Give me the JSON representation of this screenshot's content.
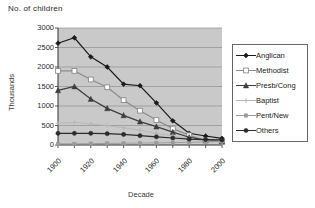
{
  "header": {
    "title": "No. of children"
  },
  "chart_data": {
    "type": "line",
    "title": "No. of children",
    "xlabel": "Decade",
    "ylabel": "Thousands",
    "grid": true,
    "legend_position": "right",
    "plot_background": "#c9c9c9",
    "xlim": [
      1900,
      2000
    ],
    "ylim": [
      0,
      3000
    ],
    "ytick_step": 500,
    "yticks": [
      0,
      500,
      1000,
      1500,
      2000,
      2500,
      3000
    ],
    "xticks": [
      1900,
      1920,
      1940,
      1960,
      1980,
      2000
    ],
    "x": [
      1900,
      1910,
      1920,
      1930,
      1940,
      1950,
      1960,
      1970,
      1980,
      1990,
      2000
    ],
    "series": [
      {
        "name": "Anglican",
        "color": "#1a1a1a",
        "marker": "diamond",
        "values": [
          2610,
          2750,
          2260,
          2000,
          1560,
          1520,
          1080,
          620,
          300,
          230,
          170
        ]
      },
      {
        "name": "Methodist",
        "color": "#8c8c8c",
        "marker": "square-open",
        "values": [
          1900,
          1900,
          1680,
          1480,
          1150,
          880,
          640,
          420,
          250,
          120,
          80
        ]
      },
      {
        "name": "Presb/Cong",
        "color": "#3d3d3d",
        "marker": "triangle",
        "values": [
          1400,
          1500,
          1180,
          940,
          760,
          600,
          470,
          330,
          200,
          120,
          90
        ]
      },
      {
        "name": "Baptist",
        "color": "#b5b5b5",
        "marker": "star",
        "values": [
          560,
          580,
          540,
          500,
          440,
          380,
          300,
          230,
          160,
          110,
          80
        ]
      },
      {
        "name": "Pent/New",
        "color": "#9a9a9a",
        "marker": "square-small",
        "values": [
          30,
          30,
          35,
          40,
          45,
          50,
          55,
          60,
          70,
          80,
          90
        ]
      },
      {
        "name": "Others",
        "color": "#2b2b2b",
        "marker": "circle",
        "values": [
          300,
          300,
          300,
          290,
          270,
          240,
          210,
          180,
          150,
          140,
          130
        ]
      }
    ]
  },
  "legend": {
    "items": [
      {
        "label": "Anglican"
      },
      {
        "label": "Methodist"
      },
      {
        "label": "Presb/Cong"
      },
      {
        "label": "Baptist"
      },
      {
        "label": "Pent/New"
      },
      {
        "label": "Others"
      }
    ]
  }
}
